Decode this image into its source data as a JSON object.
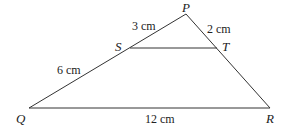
{
  "diagram": {
    "type": "triangle-with-parallel-segment",
    "stroke_color": "#333333",
    "points": {
      "P": {
        "label": "P",
        "x": 186,
        "y": 14
      },
      "Q": {
        "label": "Q",
        "x": 29,
        "y": 108
      },
      "R": {
        "label": "R",
        "x": 270,
        "y": 108
      },
      "S": {
        "label": "S",
        "x": 130,
        "y": 48
      },
      "T": {
        "label": "T",
        "x": 217,
        "y": 48
      }
    },
    "segments": [
      "PQ",
      "PR",
      "QR",
      "ST"
    ],
    "measurements": {
      "PS": "3 cm",
      "PT": "2 cm",
      "SQ": "6 cm",
      "QR": "12 cm"
    }
  }
}
